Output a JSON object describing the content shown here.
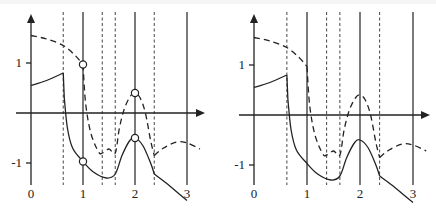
{
  "figure": {
    "panels": [
      {
        "id": "left",
        "x_tick_labels": [
          "0",
          "1",
          "2",
          "3"
        ],
        "y_tick_labels": [
          "1",
          "-1"
        ],
        "solid_verticals_x": [
          1,
          2,
          3
        ],
        "dashed_verticals_x": [
          0.62,
          1.37,
          1.62,
          2.37
        ],
        "markers": [
          {
            "x": 1,
            "y": 0.97
          },
          {
            "x": 1,
            "y": -0.97
          },
          {
            "x": 2,
            "y": 0.4
          },
          {
            "x": 2,
            "y": -0.5
          }
        ],
        "solid_curve": [
          [
            0,
            0.55
          ],
          [
            0.3,
            0.65
          ],
          [
            0.62,
            0.8
          ],
          [
            0.64,
            0.3
          ],
          [
            0.7,
            -0.3
          ],
          [
            0.8,
            -0.7
          ],
          [
            1.0,
            -0.97
          ],
          [
            1.2,
            -1.18
          ],
          [
            1.45,
            -1.3
          ],
          [
            1.62,
            -1.22
          ],
          [
            1.75,
            -0.85
          ],
          [
            1.9,
            -0.55
          ],
          [
            2.0,
            -0.5
          ],
          [
            2.15,
            -0.65
          ],
          [
            2.3,
            -1.0
          ],
          [
            2.37,
            -1.22
          ],
          [
            2.6,
            -1.4
          ],
          [
            2.85,
            -1.62
          ],
          [
            3.0,
            -1.75
          ]
        ],
        "dashed_curve_upper": [
          [
            0,
            1.55
          ],
          [
            0.3,
            1.48
          ],
          [
            0.62,
            1.35
          ],
          [
            0.85,
            1.15
          ],
          [
            1.0,
            0.97
          ]
        ],
        "dashed_curve_mid": [
          [
            1.0,
            0.97
          ],
          [
            1.05,
            0.2
          ],
          [
            1.15,
            -0.4
          ],
          [
            1.3,
            -0.78
          ],
          [
            1.37,
            -0.8
          ],
          [
            1.5,
            -0.72
          ],
          [
            1.62,
            -0.8
          ],
          [
            1.7,
            -0.3
          ],
          [
            1.8,
            0.1
          ],
          [
            1.92,
            0.35
          ],
          [
            2.0,
            0.4
          ],
          [
            2.1,
            0.3
          ],
          [
            2.2,
            0.0
          ],
          [
            2.3,
            -0.55
          ],
          [
            2.37,
            -0.85
          ]
        ],
        "dashed_curve_tail": [
          [
            2.37,
            -0.85
          ],
          [
            2.55,
            -0.7
          ],
          [
            2.8,
            -0.58
          ],
          [
            3.0,
            -0.6
          ],
          [
            3.25,
            -0.72
          ]
        ]
      },
      {
        "id": "right",
        "x_tick_labels": [
          "0",
          "1",
          "2",
          "3"
        ],
        "y_tick_labels": [
          "1",
          "-1"
        ],
        "solid_verticals_x": [
          1,
          2,
          3
        ],
        "dashed_verticals_x": [
          0.62,
          1.37,
          1.62,
          2.37
        ],
        "markers": [],
        "solid_curve": [
          [
            0,
            0.55
          ],
          [
            0.3,
            0.65
          ],
          [
            0.62,
            0.8
          ],
          [
            0.64,
            0.3
          ],
          [
            0.7,
            -0.3
          ],
          [
            0.8,
            -0.7
          ],
          [
            1.0,
            -0.97
          ],
          [
            1.2,
            -1.18
          ],
          [
            1.45,
            -1.3
          ],
          [
            1.62,
            -1.22
          ],
          [
            1.75,
            -0.85
          ],
          [
            1.9,
            -0.55
          ],
          [
            2.0,
            -0.5
          ],
          [
            2.15,
            -0.65
          ],
          [
            2.3,
            -1.0
          ],
          [
            2.37,
            -1.22
          ],
          [
            2.6,
            -1.4
          ],
          [
            2.85,
            -1.62
          ],
          [
            3.0,
            -1.75
          ]
        ],
        "dashed_curve_upper": [
          [
            0,
            1.55
          ],
          [
            0.3,
            1.48
          ],
          [
            0.62,
            1.35
          ],
          [
            0.85,
            1.15
          ],
          [
            1.0,
            0.97
          ]
        ],
        "dashed_curve_mid": [
          [
            1.0,
            0.97
          ],
          [
            1.05,
            0.2
          ],
          [
            1.15,
            -0.4
          ],
          [
            1.3,
            -0.78
          ],
          [
            1.37,
            -0.8
          ],
          [
            1.5,
            -0.72
          ],
          [
            1.62,
            -0.8
          ],
          [
            1.7,
            -0.3
          ],
          [
            1.8,
            0.1
          ],
          [
            1.92,
            0.35
          ],
          [
            2.0,
            0.4
          ],
          [
            2.1,
            0.3
          ],
          [
            2.2,
            0.0
          ],
          [
            2.3,
            -0.55
          ],
          [
            2.37,
            -0.85
          ]
        ],
        "dashed_curve_tail": [
          [
            2.37,
            -0.85
          ],
          [
            2.55,
            -0.7
          ],
          [
            2.8,
            -0.58
          ],
          [
            3.0,
            -0.6
          ],
          [
            3.25,
            -0.72
          ]
        ]
      }
    ]
  }
}
